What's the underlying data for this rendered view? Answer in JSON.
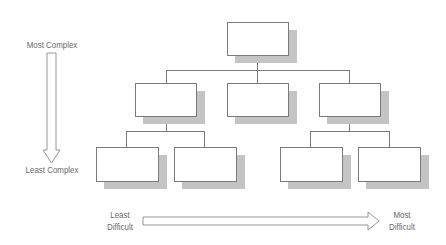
{
  "vertical_axis": {
    "top_label": "Most Complex",
    "bottom_label": "Least Complex",
    "direction": "down"
  },
  "horizontal_axis": {
    "left_label_line1": "Least",
    "left_label_line2": "Difficult",
    "right_label_line1": "Most",
    "right_label_line2": "Difficult",
    "direction": "right"
  },
  "org_chart": {
    "levels": 3,
    "root": {
      "label": ""
    },
    "level2": [
      {
        "label": ""
      },
      {
        "label": ""
      },
      {
        "label": ""
      }
    ],
    "level3": [
      {
        "label": ""
      },
      {
        "label": ""
      },
      {
        "label": ""
      },
      {
        "label": ""
      }
    ]
  },
  "colors": {
    "line": "#7a7a7a",
    "shadow": "#c4c4c4",
    "text": "#6a6a6a"
  }
}
